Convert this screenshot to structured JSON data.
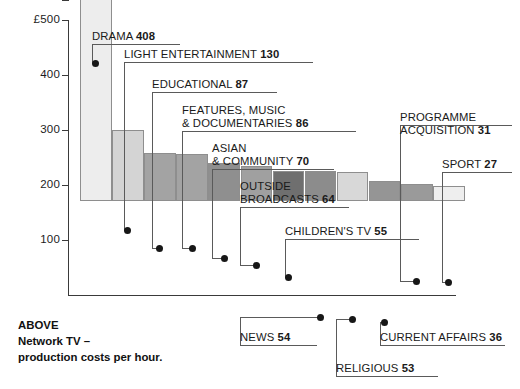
{
  "figure": {
    "caption_lines": [
      "ABOVE",
      "Network TV –",
      "production costs per hour."
    ],
    "currency_prefix": "£"
  },
  "chart_data": {
    "type": "bar",
    "title": "Network TV – production costs per hour",
    "xlabel": "",
    "ylabel": "£",
    "ylim": [
      0,
      500
    ],
    "grid": false,
    "legend": "none",
    "axis_ticks": [
      {
        "label": "£500",
        "value": 500
      },
      {
        "label": "400",
        "value": 400
      },
      {
        "label": "300",
        "value": 300
      },
      {
        "label": "200",
        "value": 200
      },
      {
        "label": "100",
        "value": 100
      }
    ],
    "categories": [
      "DRAMA",
      "LIGHT ENTERTAINMENT",
      "EDUCATIONAL",
      "FEATURES, MUSIC & DOCUMENTARIES",
      "ASIAN & COMMUNITY",
      "OUTSIDE BROADCASTS",
      "CHILDREN'S TV",
      "NEWS",
      "RELIGIOUS",
      "CURRENT AFFAIRS",
      "PROGRAMME ACQUISITION",
      "SPORT"
    ],
    "values": [
      408,
      130,
      87,
      86,
      70,
      64,
      55,
      54,
      53,
      36,
      31,
      27
    ],
    "bar_colors": [
      "#ededed",
      "#d4d4d4",
      "#a3a3a3",
      "#a3a3a3",
      "#8f8f8f",
      "#a0a0a0",
      "#6f6f6f",
      "#8c8c8c",
      "#d8d8d8",
      "#959595",
      "#9a9a9a",
      "#eeeeee"
    ]
  },
  "callouts": [
    {
      "id": "drama",
      "lines": [
        "DRAMA"
      ],
      "value": "408"
    },
    {
      "id": "light-ent",
      "lines": [
        "LIGHT ENTERTAINMENT"
      ],
      "value": "130"
    },
    {
      "id": "educational",
      "lines": [
        "EDUCATIONAL"
      ],
      "value": "87"
    },
    {
      "id": "features",
      "lines": [
        "FEATURES, MUSIC",
        "& DOCUMENTARIES"
      ],
      "value": "86"
    },
    {
      "id": "asian",
      "lines": [
        "ASIAN",
        "& COMMUNITY"
      ],
      "value": "70"
    },
    {
      "id": "outside",
      "lines": [
        "OUTSIDE",
        "BROADCASTS"
      ],
      "value": "64"
    },
    {
      "id": "childrens",
      "lines": [
        "CHILDREN'S TV"
      ],
      "value": "55"
    },
    {
      "id": "news",
      "lines": [
        "NEWS"
      ],
      "value": "54"
    },
    {
      "id": "religious",
      "lines": [
        "RELIGIOUS"
      ],
      "value": "53"
    },
    {
      "id": "current",
      "lines": [
        "CURRENT AFFAIRS"
      ],
      "value": "36"
    },
    {
      "id": "programme",
      "lines": [
        "PROGRAMME",
        "ACQUISITION"
      ],
      "value": "31"
    },
    {
      "id": "sport",
      "lines": [
        "SPORT"
      ],
      "value": "27"
    }
  ]
}
